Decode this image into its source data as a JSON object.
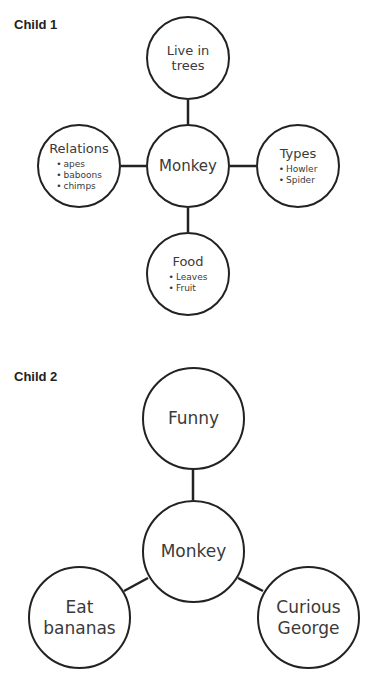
{
  "child1": {
    "title": "Child 1",
    "center": {
      "label": "Monkey"
    },
    "top": {
      "label": "Live in trees",
      "line1": "Live in",
      "line2": "trees"
    },
    "left": {
      "label": "Relations",
      "items": [
        "apes",
        "baboons",
        "chimps"
      ]
    },
    "right": {
      "label": "Types",
      "items": [
        "Howler",
        "Spider"
      ]
    },
    "bottom": {
      "label": "Food",
      "items": [
        "Leaves",
        "Fruit"
      ]
    }
  },
  "child2": {
    "title": "Child 2",
    "center": {
      "label": "Monkey"
    },
    "top": {
      "label": "Funny"
    },
    "left": {
      "label": "Eat bananas",
      "line1": "Eat",
      "line2": "bananas"
    },
    "right": {
      "label": "Curious George",
      "line1": "Curious",
      "line2": "George"
    }
  },
  "colors": {
    "stroke": "#222222",
    "text": "#3a3a3a",
    "background": "#ffffff"
  }
}
